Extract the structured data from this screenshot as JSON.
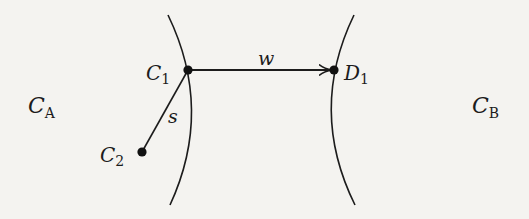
{
  "diagram": {
    "regions": [
      {
        "id": "CA",
        "label": "C",
        "subscript": "A"
      },
      {
        "id": "CB",
        "label": "C",
        "subscript": "B"
      }
    ],
    "nodes": [
      {
        "id": "C1",
        "label": "C",
        "subscript": "1"
      },
      {
        "id": "C2",
        "label": "C",
        "subscript": "2"
      },
      {
        "id": "D1",
        "label": "D",
        "subscript": "1"
      }
    ],
    "edges": [
      {
        "from": "C1",
        "to": "D1",
        "label": "w",
        "directed": true
      },
      {
        "from": "C1",
        "to": "C2",
        "label": "s",
        "directed": false
      }
    ],
    "colors": {
      "ink": "#1c1c1c",
      "background": "#f4f3f0"
    }
  }
}
